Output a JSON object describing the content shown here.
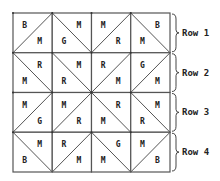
{
  "grid": {
    "left": 13,
    "top": 13,
    "cell_w": 39.25,
    "cell_h": 39.75,
    "line_color": "#555555",
    "rows": [
      {
        "label": "Row 1",
        "cells": [
          {
            "diag": "/",
            "a": "B",
            "b": "M"
          },
          {
            "diag": "\\",
            "a": "M",
            "b": "G"
          },
          {
            "diag": "/",
            "a": "M",
            "b": "R"
          },
          {
            "diag": "\\",
            "a": "B",
            "b": "M"
          }
        ]
      },
      {
        "label": "Row 2",
        "cells": [
          {
            "diag": "\\",
            "a": "R",
            "b": "M"
          },
          {
            "diag": "\\",
            "a": "M",
            "b": "R"
          },
          {
            "diag": "/",
            "a": "R",
            "b": "M"
          },
          {
            "diag": "/",
            "a": "G",
            "b": "M"
          }
        ]
      },
      {
        "label": "Row 3",
        "cells": [
          {
            "diag": "/",
            "a": "M",
            "b": "G"
          },
          {
            "diag": "/",
            "a": "M",
            "b": "R"
          },
          {
            "diag": "\\",
            "a": "R",
            "b": "M"
          },
          {
            "diag": "\\",
            "a": "M",
            "b": "R"
          }
        ]
      },
      {
        "label": "Row 4",
        "cells": [
          {
            "diag": "\\",
            "a": "M",
            "b": "B"
          },
          {
            "diag": "/",
            "a": "R",
            "b": "M"
          },
          {
            "diag": "\\",
            "a": "G",
            "b": "M"
          },
          {
            "diag": "/",
            "a": "M",
            "b": "B"
          }
        ]
      }
    ]
  }
}
